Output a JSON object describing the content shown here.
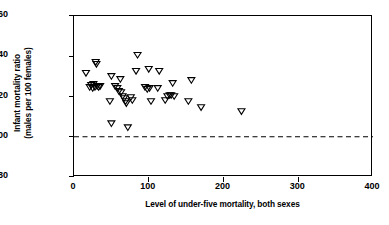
{
  "chart_data": {
    "type": "scatter",
    "title": "",
    "xlabel": "Level of under-five mortality, both sexes",
    "ylabel_line1": "Infant mortality ratio",
    "ylabel_line2": "(males per 100 females)",
    "xlim": [
      0,
      400
    ],
    "ylim": [
      80,
      160
    ],
    "xticks": [
      0,
      100,
      200,
      300,
      400
    ],
    "yticks": [
      80,
      100,
      120,
      140,
      160
    ],
    "xticklabels": [
      "0",
      "100",
      "200",
      "300",
      "400"
    ],
    "yticklabels": [
      "80",
      "100",
      "120",
      "140",
      "160"
    ],
    "grid": false,
    "legend": null,
    "marker": "triangle-down-open",
    "marker_color": "#000000",
    "reference_line": {
      "axis": "y",
      "value": 100,
      "style": "dashed",
      "color": "#000000"
    },
    "points": [
      {
        "x": 16,
        "y": 131.5
      },
      {
        "x": 21,
        "y": 124.5
      },
      {
        "x": 23,
        "y": 125.5
      },
      {
        "x": 25,
        "y": 124.0
      },
      {
        "x": 26,
        "y": 126.0
      },
      {
        "x": 28,
        "y": 124.5
      },
      {
        "x": 29,
        "y": 137.0
      },
      {
        "x": 30,
        "y": 136.0
      },
      {
        "x": 31,
        "y": 125.0
      },
      {
        "x": 33,
        "y": 124.5
      },
      {
        "x": 35,
        "y": 125.0
      },
      {
        "x": 48,
        "y": 117.5
      },
      {
        "x": 50,
        "y": 130.0
      },
      {
        "x": 50,
        "y": 106.5
      },
      {
        "x": 55,
        "y": 125.0
      },
      {
        "x": 58,
        "y": 124.0
      },
      {
        "x": 60,
        "y": 122.5
      },
      {
        "x": 62,
        "y": 128.5
      },
      {
        "x": 63,
        "y": 122.0
      },
      {
        "x": 65,
        "y": 120.0
      },
      {
        "x": 67,
        "y": 119.0
      },
      {
        "x": 69,
        "y": 117.5
      },
      {
        "x": 70,
        "y": 116.5
      },
      {
        "x": 72,
        "y": 104.5
      },
      {
        "x": 76,
        "y": 119.5
      },
      {
        "x": 78,
        "y": 118.0
      },
      {
        "x": 83,
        "y": 132.5
      },
      {
        "x": 85,
        "y": 140.5
      },
      {
        "x": 95,
        "y": 124.5
      },
      {
        "x": 98,
        "y": 123.5
      },
      {
        "x": 100,
        "y": 133.5
      },
      {
        "x": 101,
        "y": 124.0
      },
      {
        "x": 103,
        "y": 117.5
      },
      {
        "x": 112,
        "y": 124.0
      },
      {
        "x": 114,
        "y": 132.5
      },
      {
        "x": 122,
        "y": 118.0
      },
      {
        "x": 125,
        "y": 120.0
      },
      {
        "x": 128,
        "y": 120.5
      },
      {
        "x": 130,
        "y": 120.5
      },
      {
        "x": 132,
        "y": 126.5
      },
      {
        "x": 134,
        "y": 120.0
      },
      {
        "x": 153,
        "y": 117.5
      },
      {
        "x": 157,
        "y": 128.0
      },
      {
        "x": 170,
        "y": 114.5
      },
      {
        "x": 224,
        "y": 112.5
      }
    ]
  }
}
